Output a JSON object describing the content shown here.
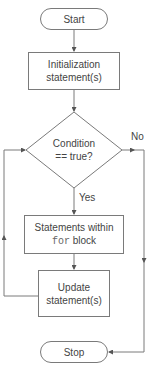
{
  "diagram": {
    "type": "flowchart",
    "colors": {
      "stroke": "#7a7a7a",
      "text": "#444444",
      "background": "#ffffff"
    },
    "nodes": {
      "start": {
        "shape": "terminator",
        "label": "Start"
      },
      "init": {
        "shape": "process",
        "line1": "Initialization",
        "line2": "statement(s)"
      },
      "condition": {
        "shape": "decision",
        "line1": "Condition",
        "line2": "== true?"
      },
      "body": {
        "shape": "process",
        "line1": "Statements within",
        "line2_code": "for",
        "line2_text": " block"
      },
      "update": {
        "shape": "process",
        "line1": "Update",
        "line2": "statement(s)"
      },
      "stop": {
        "shape": "terminator",
        "label": "Stop"
      }
    },
    "edges": [
      {
        "from": "start",
        "to": "init",
        "label": ""
      },
      {
        "from": "init",
        "to": "condition",
        "label": ""
      },
      {
        "from": "condition",
        "to": "body",
        "label": "Yes"
      },
      {
        "from": "condition",
        "to": "stop",
        "label": "No"
      },
      {
        "from": "body",
        "to": "update",
        "label": ""
      },
      {
        "from": "update",
        "to": "condition",
        "label": ""
      }
    ],
    "edge_labels": {
      "yes": "Yes",
      "no": "No"
    }
  }
}
